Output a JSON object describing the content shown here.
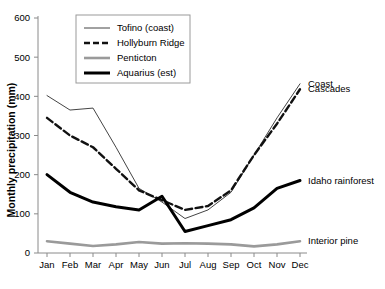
{
  "chart_data": {
    "type": "line",
    "title": "",
    "xlabel": "",
    "ylabel": "Monthly precipitation (mm)",
    "categories": [
      "Jan",
      "Feb",
      "Mar",
      "Apr",
      "May",
      "Jun",
      "Jul",
      "Aug",
      "Sep",
      "Oct",
      "Nov",
      "Dec"
    ],
    "ylim": [
      0,
      600
    ],
    "yticks": [
      0,
      100,
      200,
      300,
      400,
      500,
      600
    ],
    "grid": false,
    "legend_position": "top-left",
    "series": [
      {
        "name": "Tofino (coast)",
        "style": "thin-solid",
        "color": "#444444",
        "values": [
          402,
          365,
          370,
          270,
          165,
          130,
          88,
          110,
          155,
          250,
          345,
          432
        ]
      },
      {
        "name": "Hollyburn Ridge",
        "style": "dashed",
        "color": "#111111",
        "values": [
          345,
          300,
          270,
          215,
          160,
          135,
          110,
          120,
          160,
          250,
          330,
          418
        ]
      },
      {
        "name": "Penticton",
        "style": "thick-gray-solid",
        "color": "#9a9a9a",
        "values": [
          30,
          24,
          18,
          22,
          28,
          24,
          25,
          24,
          22,
          17,
          22,
          30
        ]
      },
      {
        "name": "Aquarius (est)",
        "style": "thick-solid",
        "color": "#000000",
        "values": [
          200,
          155,
          130,
          118,
          110,
          145,
          55,
          70,
          85,
          115,
          165,
          185
        ]
      }
    ],
    "annotations": [
      {
        "text": "Coast",
        "series": "Tofino (coast)"
      },
      {
        "text": "Cascades",
        "series": "Hollyburn Ridge"
      },
      {
        "text": "Idaho rainforest",
        "series": "Aquarius (est)"
      },
      {
        "text": "Interior pine",
        "series": "Penticton"
      }
    ]
  },
  "legend": {
    "items": [
      {
        "label": "Tofino (coast)"
      },
      {
        "label": "Hollyburn Ridge"
      },
      {
        "label": "Penticton"
      },
      {
        "label": "Aquarius (est)"
      }
    ]
  }
}
